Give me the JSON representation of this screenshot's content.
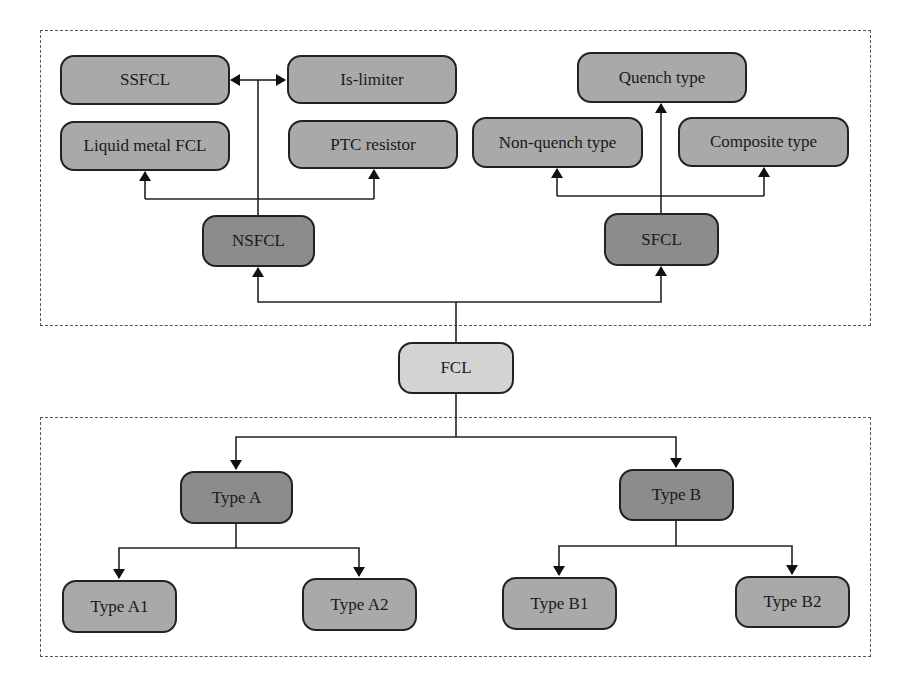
{
  "colors": {
    "root_fill": "#d3d3d3",
    "category_fill": "#8c8c8c",
    "leaf_fill": "#a9a9a9",
    "stroke": "#222222",
    "group_border": "#555555"
  },
  "root": {
    "label": "FCL"
  },
  "top_group": {
    "nsfcl": {
      "label": "NSFCL",
      "children": [
        "SSFCL",
        "Is-limiter",
        "Liquid metal FCL",
        "PTC resistor"
      ]
    },
    "sfcl": {
      "label": "SFCL",
      "children": [
        "Quench type",
        "Non-quench type",
        "Composite type"
      ]
    }
  },
  "bottom_group": {
    "type_a": {
      "label": "Type A",
      "children": [
        "Type A1",
        "Type A2"
      ]
    },
    "type_b": {
      "label": "Type B",
      "children": [
        "Type B1",
        "Type B2"
      ]
    }
  }
}
